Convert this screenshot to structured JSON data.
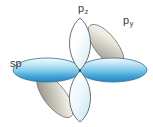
{
  "figure": {
    "kind": "orbital-diagram",
    "background_color": "#ffffff",
    "center": {
      "x": 80,
      "y": 71
    }
  },
  "labels": {
    "sp": {
      "text": "sp",
      "sub": "",
      "color": "#3b3b3b"
    },
    "pz": {
      "text": "p",
      "sub": "z",
      "color": "#3b3b3b"
    },
    "py": {
      "text": "p",
      "sub": "y",
      "color": "#3b3b3b"
    }
  },
  "colors": {
    "sp_light": "#eaf6fb",
    "sp_mid": "#8fd0ea",
    "sp_deep": "#2b8fcf",
    "sp_outline": "#2f6f93",
    "pz_light": "#ffffff",
    "pz_tint": "#cfe9f3",
    "pz_outline": "#4a4a4a",
    "py_light": "#f2f0e9",
    "py_mid": "#cfcbbd",
    "py_deep": "#8e8b82",
    "py_outline": "#5a5852"
  },
  "orbitals": [
    {
      "name": "sp-lobe-left",
      "label": "sp",
      "type": "sp",
      "orientation": "horizontal-left",
      "color": "blue"
    },
    {
      "name": "sp-lobe-right",
      "label": "sp",
      "type": "sp",
      "orientation": "horizontal-right",
      "color": "blue"
    },
    {
      "name": "pz-lobe-top",
      "label": "pz",
      "type": "p",
      "orientation": "vertical-up",
      "color": "pale-blue"
    },
    {
      "name": "pz-lobe-bottom",
      "label": "pz",
      "type": "p",
      "orientation": "vertical-down",
      "color": "pale-blue"
    },
    {
      "name": "py-lobe-upper-right",
      "label": "py",
      "type": "p",
      "orientation": "diagonal-up-right",
      "color": "gray"
    },
    {
      "name": "py-lobe-lower-left",
      "label": "py",
      "type": "p",
      "orientation": "diagonal-down-left",
      "color": "gray"
    }
  ]
}
